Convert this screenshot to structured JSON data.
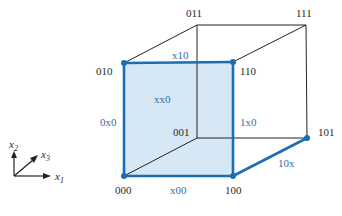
{
  "diagram": {
    "colors": {
      "edge": "#222222",
      "highlight": "#1d6db3",
      "face_fill": "#d6e8f5",
      "label_blue": "#2f6fa8"
    },
    "vertices": [
      {
        "id": "000",
        "label": "000",
        "x": 124,
        "y": 176,
        "highlighted": true
      },
      {
        "id": "100",
        "label": "100",
        "x": 233,
        "y": 176,
        "highlighted": true
      },
      {
        "id": "010",
        "label": "010",
        "x": 124,
        "y": 63,
        "highlighted": true
      },
      {
        "id": "110",
        "label": "110",
        "x": 233,
        "y": 62,
        "highlighted": true
      },
      {
        "id": "001",
        "label": "001",
        "x": 197,
        "y": 138,
        "highlighted": false
      },
      {
        "id": "101",
        "label": "101",
        "x": 307,
        "y": 138,
        "highlighted": true
      },
      {
        "id": "011",
        "label": "011",
        "x": 197,
        "y": 25,
        "highlighted": false
      },
      {
        "id": "111",
        "label": "111",
        "x": 306,
        "y": 25,
        "highlighted": false
      }
    ],
    "edge_labels": {
      "top_front": "x10",
      "left_front": "0x0",
      "right_front": "1x0",
      "bottom_front": "x00",
      "bottom_right": "10x",
      "face": "xx0"
    },
    "axes": {
      "x1": {
        "label": "x",
        "sub": "1"
      },
      "x2": {
        "label": "x",
        "sub": "2"
      },
      "x3": {
        "label": "x",
        "sub": "3"
      }
    }
  }
}
